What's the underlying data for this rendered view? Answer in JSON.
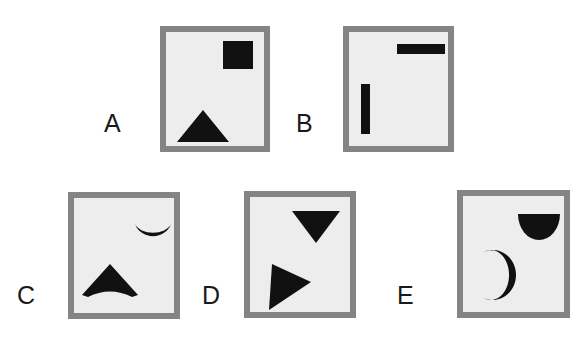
{
  "figure": {
    "background_color": "#ffffff",
    "panel_border_color": "#848484",
    "panel_fill_color": "#ededed",
    "shape_color": "#111111",
    "label_color": "#1a1a1a",
    "panel_count": 5
  },
  "panels": [
    {
      "label": "A",
      "label_side": "left",
      "box": {
        "left": 160,
        "top": 26,
        "width": 110,
        "height": 126
      },
      "label_pos": {
        "left": 104,
        "top": 111
      },
      "shapes": [
        {
          "name": "filled-square",
          "kind": "square",
          "position": "upper-right",
          "box": {
            "left": 57,
            "top": 9,
            "width": 30,
            "height": 28
          },
          "rotation_deg": 0
        },
        {
          "name": "upward-triangle",
          "kind": "triangle",
          "position": "lower-left",
          "box": {
            "left": 11,
            "top": 78,
            "width": 52,
            "height": 32
          },
          "rotation_deg": 0
        }
      ]
    },
    {
      "label": "B",
      "label_side": "left",
      "box": {
        "left": 343,
        "top": 26,
        "width": 111,
        "height": 126
      },
      "label_pos": {
        "left": 296,
        "top": 111
      },
      "shapes": [
        {
          "name": "horizontal-bar",
          "kind": "rectangle",
          "position": "upper-right",
          "box": {
            "left": 48,
            "top": 12,
            "width": 48,
            "height": 10
          },
          "rotation_deg": 0
        },
        {
          "name": "vertical-bar",
          "kind": "rectangle",
          "position": "lower-left",
          "box": {
            "left": 12,
            "top": 52,
            "width": 9,
            "height": 50
          },
          "rotation_deg": 0
        }
      ]
    },
    {
      "label": "C",
      "label_side": "left",
      "box": {
        "left": 68,
        "top": 192,
        "width": 112,
        "height": 127
      },
      "label_pos": {
        "left": 17,
        "top": 283
      },
      "shapes": [
        {
          "name": "crescent-up",
          "kind": "crescent",
          "position": "upper-right",
          "box": {
            "left": 60,
            "top": 24,
            "width": 38,
            "height": 36
          },
          "rotation_deg": 0
        },
        {
          "name": "concave-arrowhead-up",
          "kind": "arrowhead",
          "position": "lower-left",
          "box": {
            "left": 8,
            "top": 66,
            "width": 56,
            "height": 34
          },
          "rotation_deg": 0
        }
      ]
    },
    {
      "label": "D",
      "label_side": "left",
      "box": {
        "left": 244,
        "top": 191,
        "width": 112,
        "height": 127
      },
      "label_pos": {
        "left": 202,
        "top": 283
      },
      "shapes": [
        {
          "name": "downward-triangle",
          "kind": "triangle",
          "position": "upper-center",
          "box": {
            "left": 42,
            "top": 14,
            "width": 48,
            "height": 32
          },
          "rotation_deg": 180
        },
        {
          "name": "right-pointing-triangle",
          "kind": "triangle",
          "position": "lower-left",
          "box": {
            "left": 13,
            "top": 66,
            "width": 48,
            "height": 48
          },
          "rotation_deg": 20
        }
      ]
    },
    {
      "label": "E",
      "label_side": "left",
      "box": {
        "left": 457,
        "top": 190,
        "width": 113,
        "height": 128
      },
      "label_pos": {
        "left": 397,
        "top": 283
      },
      "shapes": [
        {
          "name": "half-disc-down",
          "kind": "semicircle",
          "position": "upper-right",
          "box": {
            "left": 55,
            "top": 18,
            "width": 42,
            "height": 26
          },
          "rotation_deg": 0
        },
        {
          "name": "crescent-left",
          "kind": "crescent",
          "position": "lower-left",
          "box": {
            "left": 16,
            "top": 54,
            "width": 34,
            "height": 50
          },
          "rotation_deg": 0
        }
      ]
    }
  ]
}
